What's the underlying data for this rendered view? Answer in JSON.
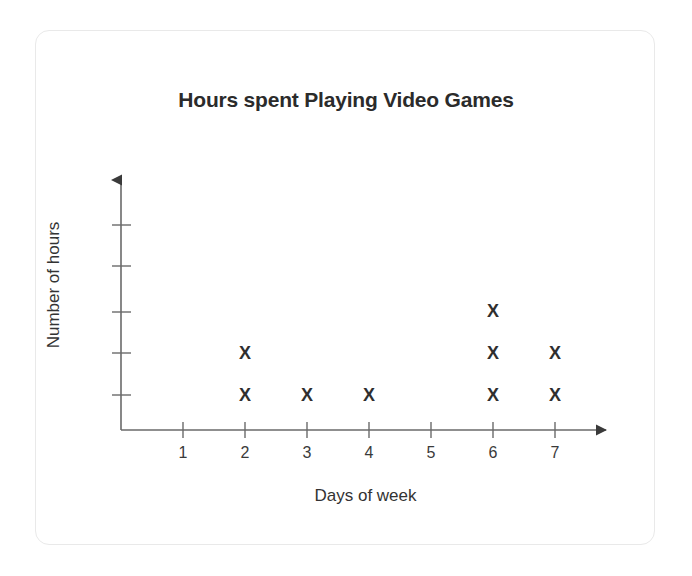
{
  "card": {
    "background": "#ffffff",
    "border_color": "#e9e9e9"
  },
  "chart_data": {
    "type": "scatter",
    "plot_style": "dot-plot",
    "marker": "X",
    "title": "Hours spent Playing Video Games",
    "xlabel": "Days of week",
    "ylabel": "Number of hours",
    "categories": [
      "1",
      "2",
      "3",
      "4",
      "5",
      "6",
      "7"
    ],
    "x": [
      1,
      2,
      3,
      4,
      5,
      6,
      7
    ],
    "values": [
      0,
      2,
      1,
      1,
      0,
      3,
      2
    ],
    "xlim": [
      0,
      7
    ],
    "ylim": [
      0,
      5
    ],
    "y_tick_count": 5,
    "y_tick_labels": [],
    "grid": false,
    "legend": null,
    "axis_arrows": true,
    "marker_color": "#2f2f2f",
    "axis_color": "#4a4a4a",
    "points": [
      {
        "day": 2,
        "count": 2
      },
      {
        "day": 3,
        "count": 1
      },
      {
        "day": 4,
        "count": 1
      },
      {
        "day": 6,
        "count": 3
      },
      {
        "day": 7,
        "count": 2
      }
    ]
  }
}
